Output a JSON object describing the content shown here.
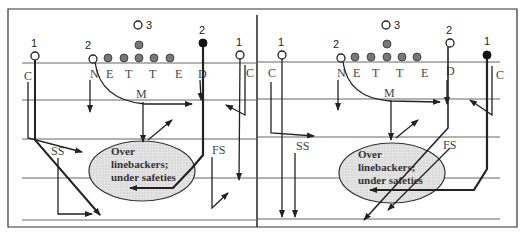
{
  "diagram": {
    "type": "football-play-diagram",
    "panels": [
      {
        "id": "left",
        "players_offense": [
          {
            "label": "1",
            "kind": "open"
          },
          {
            "label": "2",
            "kind": "open"
          },
          {
            "label": "3",
            "kind": "open"
          },
          {
            "label": "2",
            "kind": "filled"
          },
          {
            "label": "1",
            "kind": "open"
          }
        ],
        "defense_labels": [
          "C",
          "N",
          "E",
          "T",
          "T",
          "E",
          "D",
          "M",
          "C",
          "SS",
          "FS"
        ],
        "zone_text": [
          "Over",
          "linebackers;",
          "under safeties"
        ]
      },
      {
        "id": "right",
        "players_offense": [
          {
            "label": "1",
            "kind": "open"
          },
          {
            "label": "2",
            "kind": "open"
          },
          {
            "label": "3",
            "kind": "open"
          },
          {
            "label": "2",
            "kind": "open"
          },
          {
            "label": "1",
            "kind": "filled"
          }
        ],
        "defense_labels": [
          "C",
          "N",
          "E",
          "T",
          "T",
          "E",
          "D",
          "M",
          "C",
          "SS",
          "FS"
        ],
        "zone_text": [
          "Over",
          "linebackers;",
          "under safeties"
        ]
      }
    ],
    "labels": {
      "c": "C",
      "n": "N",
      "e": "E",
      "t": "T",
      "d": "D",
      "m": "M",
      "ss": "SS",
      "fs": "FS",
      "one": "1",
      "two": "2",
      "three": "3",
      "zone1": "Over",
      "zone2": "linebackers;",
      "zone3": "under safeties"
    }
  }
}
